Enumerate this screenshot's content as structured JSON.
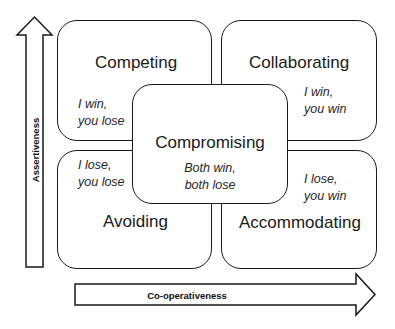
{
  "diagram": {
    "type": "conflict-modes-grid",
    "axes": {
      "vertical": {
        "label": "Assertiveness",
        "direction": "up"
      },
      "horizontal": {
        "label": "Co-operativeness",
        "direction": "right"
      }
    },
    "quadrants": {
      "top_left": {
        "title": "Competing",
        "note_line1": "I win,",
        "note_line2": "you lose"
      },
      "top_right": {
        "title": "Collaborating",
        "note_line1": "I win,",
        "note_line2": "you win"
      },
      "bottom_left": {
        "title": "Avoiding",
        "note_line1": "I lose,",
        "note_line2": "you lose"
      },
      "bottom_right": {
        "title": "Accommodating",
        "note_line1": "I lose,",
        "note_line2": "you win"
      }
    },
    "center": {
      "title": "Compromising",
      "note_line1": "Both win,",
      "note_line2": "both lose"
    },
    "colors": {
      "stroke": "#1a1a1a",
      "fill": "#ffffff",
      "text": "#1a1a1a"
    }
  }
}
